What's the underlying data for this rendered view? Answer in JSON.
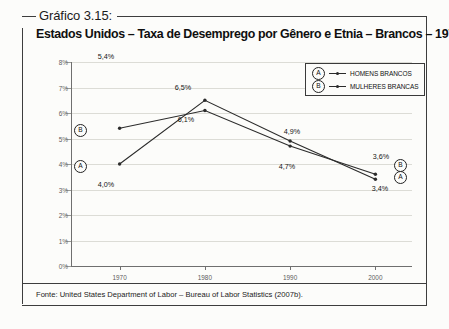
{
  "figure": {
    "caption_label": "Gráfico 3.15:",
    "title": "Estados Unidos – Taxa de Desemprego por Gênero e Etnia – Brancos – 1970 a 2000",
    "source": "Fonte: United States Department of Labor – Bureau of Labor Statistics (2007b)."
  },
  "legend": {
    "items": [
      {
        "badge": "A",
        "label": "HOMENS BRANCOS"
      },
      {
        "badge": "B",
        "label": "MULHERES BRANCAS"
      }
    ]
  },
  "axes": {
    "y_ticks": [
      "0%",
      "1%",
      "2%",
      "3%",
      "4%",
      "5%",
      "6%",
      "7%",
      "8%"
    ],
    "x_ticks": [
      "1970",
      "1980",
      "1990",
      "2000"
    ]
  },
  "labels": {
    "a_1970": "4,0%",
    "a_1980": "6,5%",
    "a_1990": "4,9%",
    "a_2000": "3,4%",
    "b_1970": "5,4%",
    "b_1980": "6,1%",
    "b_1990": "4,7%",
    "b_2000": "3,6%",
    "badge_a": "A",
    "badge_b": "B"
  },
  "chart_data": {
    "type": "line",
    "title": "Estados Unidos – Taxa de Desemprego por Gênero e Etnia – Brancos – 1970 a 2000",
    "xlabel": "",
    "ylabel": "",
    "x": [
      1970,
      1980,
      1990,
      2000
    ],
    "categories": [
      "1970",
      "1980",
      "1990",
      "2000"
    ],
    "ylim": [
      0,
      8
    ],
    "ytick_values": [
      0,
      1,
      2,
      3,
      4,
      5,
      6,
      7,
      8
    ],
    "ytick_labels": [
      "0%",
      "1%",
      "2%",
      "3%",
      "4%",
      "5%",
      "6%",
      "7%",
      "8%"
    ],
    "grid": true,
    "legend_position": "top-right",
    "value_suffix": "%",
    "decimal_separator": ",",
    "series": [
      {
        "name": "HOMENS BRANCOS",
        "badge": "A",
        "values": [
          4.0,
          6.5,
          4.9,
          3.4
        ],
        "point_labels": [
          "4,0%",
          "6,5%",
          "4,9%",
          "3,4%"
        ]
      },
      {
        "name": "MULHERES BRANCAS",
        "badge": "B",
        "values": [
          5.4,
          6.1,
          4.7,
          3.6
        ],
        "point_labels": [
          "5,4%",
          "6,1%",
          "4,7%",
          "3,6%"
        ]
      }
    ]
  }
}
